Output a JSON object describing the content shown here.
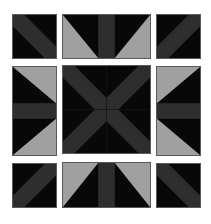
{
  "puzzle": {
    "grid": "3x3",
    "colors": {
      "background": "#080808",
      "band": "#2e2e2e",
      "light": "#a0a0a0",
      "border": "#5a5a5a",
      "page": "#ffffff"
    },
    "tiles": [
      {
        "id": "top-left",
        "pattern": "diagonal-band-down"
      },
      {
        "id": "top-center",
        "pattern": "vertical-band-with-bottom-triangles"
      },
      {
        "id": "top-right",
        "pattern": "diagonal-band-up"
      },
      {
        "id": "middle-left",
        "pattern": "horizontal-band-with-right-triangles"
      },
      {
        "id": "center",
        "pattern": "x-cross"
      },
      {
        "id": "middle-right",
        "pattern": "horizontal-band-with-left-triangles"
      },
      {
        "id": "bottom-left",
        "pattern": "diagonal-band-up"
      },
      {
        "id": "bottom-center",
        "pattern": "vertical-band-with-top-triangles"
      },
      {
        "id": "bottom-right",
        "pattern": "diagonal-band-down"
      }
    ]
  }
}
